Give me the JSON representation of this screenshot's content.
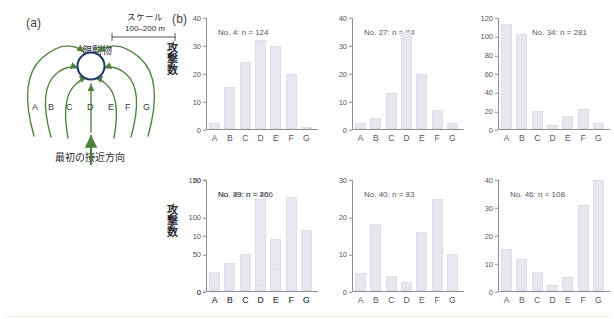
{
  "panels": {
    "a": {
      "letter": "(a)",
      "scale_title": "スケール",
      "scale_value": "100–200 m",
      "prey_label": "餌動物",
      "approach_label": "最初の接近方向",
      "direction_letters": [
        "A",
        "B",
        "C",
        "D",
        "E",
        "F",
        "G"
      ],
      "colors": {
        "arrow": "#4f7f3f",
        "circle": "#1f3864"
      }
    },
    "b": {
      "letter": "(b)",
      "ylabel": "攻撃数"
    }
  },
  "chart_data": [
    {
      "type": "bar",
      "title": "No. 4: n = 124",
      "title_pos": "left",
      "categories": [
        "A",
        "B",
        "C",
        "D",
        "E",
        "F",
        "G"
      ],
      "values": [
        2,
        15,
        24,
        32,
        30,
        20,
        0.5
      ],
      "ylabel": "攻撃数",
      "xlabel": "",
      "ylim": [
        0,
        40
      ],
      "yticks": [
        0,
        10,
        20,
        30,
        40
      ],
      "grid": false,
      "bar_color": "#e7e7ef"
    },
    {
      "type": "bar",
      "title": "No. 27: n = 84",
      "title_pos": "left",
      "categories": [
        "A",
        "B",
        "C",
        "D",
        "E",
        "F",
        "G"
      ],
      "values": [
        2,
        4,
        13,
        35,
        20,
        7,
        2
      ],
      "ylabel": "",
      "xlabel": "",
      "ylim": [
        0,
        40
      ],
      "yticks": [
        0,
        10,
        20,
        30,
        40
      ],
      "grid": false,
      "bar_color": "#e7e7ef"
    },
    {
      "type": "bar",
      "title": "No. 34: n = 281",
      "title_pos": "right",
      "categories": [
        "A",
        "B",
        "C",
        "D",
        "E",
        "F",
        "G"
      ],
      "values": [
        114,
        103,
        20,
        4,
        14,
        22,
        6
      ],
      "ylabel": "",
      "xlabel": "",
      "ylim": [
        0,
        120
      ],
      "yticks": [
        0,
        20,
        40,
        60,
        80,
        100,
        120
      ],
      "grid": false,
      "bar_color": "#e7e7ef"
    },
    {
      "type": "bar",
      "title": "No. 39: n = 266",
      "title_pos": "left",
      "categories": [
        "A",
        "B",
        "C",
        "D",
        "E",
        "F",
        "G"
      ],
      "values": [
        0,
        25,
        50,
        125,
        70,
        19,
        1
      ],
      "ylabel": "攻撃数",
      "xlabel": "",
      "ylim": [
        0,
        150
      ],
      "yticks": [
        0,
        50,
        100,
        150
      ],
      "grid": false,
      "bar_color": "#e7e7ef"
    },
    {
      "type": "bar",
      "title": "No. 40: n = 83",
      "title_pos": "left",
      "categories": [
        "A",
        "B",
        "C",
        "D",
        "E",
        "F",
        "G"
      ],
      "values": [
        5,
        18,
        4,
        2.5,
        16,
        25,
        10
      ],
      "ylabel": "",
      "xlabel": "",
      "ylim": [
        0,
        30
      ],
      "yticks": [
        0,
        10,
        20,
        30
      ],
      "grid": false,
      "bar_color": "#e7e7ef"
    },
    {
      "type": "bar",
      "title": "No. 46: n = 108",
      "title_pos": "left",
      "categories": [
        "A",
        "B",
        "C",
        "D",
        "E",
        "F",
        "G"
      ],
      "values": [
        15,
        11.5,
        7,
        2,
        5,
        31,
        40
      ],
      "ylabel": "",
      "xlabel": "",
      "ylim": [
        0,
        40
      ],
      "yticks": [
        0,
        10,
        20,
        30,
        40
      ],
      "grid": false,
      "bar_color": "#e7e7ef"
    },
    {
      "type": "bar",
      "title": "No. 49: n = 40",
      "title_pos": "left",
      "categories": [
        "A",
        "B",
        "C",
        "D",
        "E",
        "F",
        "G"
      ],
      "values": [
        3.5,
        5,
        1,
        1,
        4,
        17,
        11
      ],
      "ylabel": "",
      "xlabel": "",
      "ylim": [
        0,
        20
      ],
      "yticks": [
        0,
        10,
        20
      ],
      "grid": false,
      "bar_color": "#e7e7ef"
    }
  ]
}
